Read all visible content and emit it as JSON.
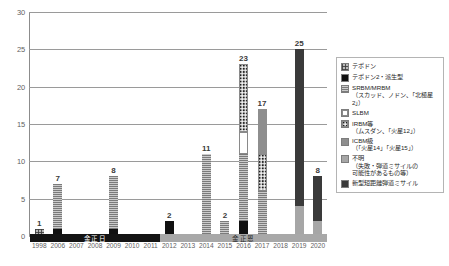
{
  "chart_data": {
    "type": "bar",
    "stacked": true,
    "title": "",
    "subtitle": "",
    "xlabel": "",
    "ylabel": "",
    "ylim": [
      0,
      30
    ],
    "ytick_labels": [
      "0",
      "5",
      "10",
      "15",
      "20",
      "25",
      "30"
    ],
    "ytick_values": [
      0,
      5,
      10,
      15,
      20,
      25,
      30
    ],
    "grid": true,
    "legend_position": "right",
    "categories": [
      "1998",
      "2006",
      "2007",
      "2008",
      "2009",
      "2010",
      "2011",
      "2012",
      "2013",
      "2014",
      "2015",
      "2016",
      "2017",
      "2018",
      "2019",
      "2020"
    ],
    "totals": [
      1,
      7,
      0,
      0,
      8,
      0,
      0,
      2,
      0,
      11,
      2,
      23,
      17,
      0,
      25,
      8
    ],
    "series": [
      {
        "name": "テポドン",
        "key": "taepodong",
        "fill": "crosshatch",
        "values": [
          1,
          0,
          0,
          0,
          0,
          0,
          0,
          0,
          0,
          0,
          0,
          0,
          0,
          0,
          0,
          0
        ]
      },
      {
        "name": "テポドン2・派生型",
        "key": "taepodong2",
        "fill": "solid-black",
        "values": [
          0,
          1,
          0,
          0,
          1,
          0,
          0,
          2,
          0,
          0,
          0,
          2,
          0,
          0,
          0,
          0
        ]
      },
      {
        "name": "SRBM/MRBM",
        "key": "srbm",
        "fill": "horizontal-lines",
        "values": [
          0,
          6,
          0,
          0,
          7,
          0,
          0,
          0,
          0,
          11,
          2,
          9,
          6,
          0,
          0,
          0
        ]
      },
      {
        "name": "SLBM",
        "key": "slbm",
        "fill": "white",
        "values": [
          0,
          0,
          0,
          0,
          0,
          0,
          0,
          0,
          0,
          0,
          0,
          3,
          0,
          0,
          0,
          0
        ]
      },
      {
        "name": "IRBM等",
        "key": "irbm",
        "fill": "dotted",
        "values": [
          0,
          0,
          0,
          0,
          0,
          0,
          0,
          0,
          0,
          0,
          0,
          9,
          5,
          0,
          0,
          0
        ]
      },
      {
        "name": "ICBM級",
        "key": "icbm",
        "fill": "mid-gray",
        "values": [
          0,
          0,
          0,
          0,
          0,
          0,
          0,
          0,
          0,
          0,
          0,
          0,
          6,
          0,
          0,
          0
        ]
      },
      {
        "name": "不明",
        "key": "unknown",
        "fill": "light-gray",
        "values": [
          0,
          0,
          0,
          0,
          0,
          0,
          0,
          0,
          0,
          0,
          0,
          0,
          0,
          0,
          4,
          2
        ]
      },
      {
        "name": "新型短距離弾道ミサイル",
        "key": "newsrbm",
        "fill": "dark-gray",
        "values": [
          0,
          0,
          0,
          0,
          0,
          0,
          0,
          0,
          0,
          0,
          0,
          0,
          0,
          0,
          21,
          6
        ]
      }
    ],
    "legend": [
      {
        "label": "テポドン",
        "swatch": "crosshatch-swatch"
      },
      {
        "label": "テポドン2・派生型",
        "swatch": "solid-black-swatch"
      },
      {
        "label": "SRBM/MRBM\n（スカッド、ノドン、「北極星2」）",
        "swatch": "horizontal-lines-swatch"
      },
      {
        "label": "SLBM",
        "swatch": "white-swatch"
      },
      {
        "label": "IRBM等\n（ムスダン、「火星12」）",
        "swatch": "dotted-swatch"
      },
      {
        "label": "ICBM級\n（「火星14」「火星15」）",
        "swatch": "mid-gray-swatch"
      },
      {
        "label": "不明\n（失敗・弾道ミサイルの\n可能性があるもの等）",
        "swatch": "light-gray-swatch"
      },
      {
        "label": "新型短距離弾道ミサイル",
        "swatch": "dark-gray-swatch"
      }
    ],
    "annotations": [
      {
        "label": "金正日",
        "from": "1998",
        "to": "2011",
        "style": "dark"
      },
      {
        "label": "金正恩",
        "from": "2012",
        "to": "2020",
        "style": "light"
      }
    ]
  }
}
